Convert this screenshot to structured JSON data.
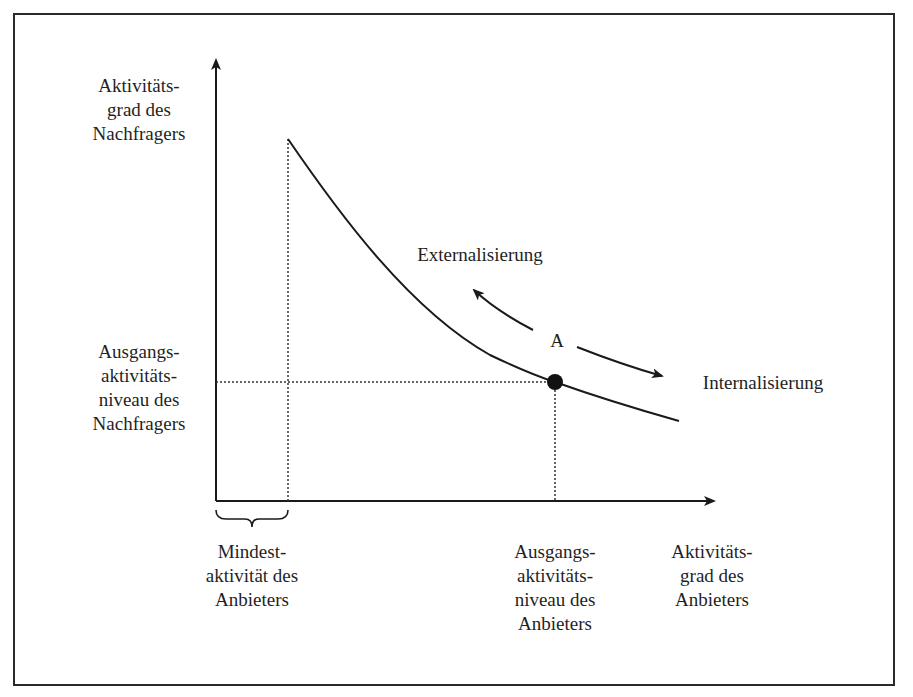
{
  "diagram": {
    "y_axis_label": [
      "Aktivitäts-",
      "grad des",
      "Nachfragers"
    ],
    "y_reference_label": [
      "Ausgangs-",
      "aktivitäts-",
      "niveau des",
      "Nachfragers"
    ],
    "x_axis_label": [
      "Aktivitäts-",
      "grad des",
      "Anbieters"
    ],
    "x_reference_label": [
      "Ausgangs-",
      "aktivitäts-",
      "niveau des",
      "Anbieters"
    ],
    "x_min_label": [
      "Mindest-",
      "aktivität des",
      "Anbieters"
    ],
    "point_label": "A",
    "direction_left_label": "Externalisierung",
    "direction_right_label": "Internalisierung",
    "colors": {
      "line": "#1a1a1a",
      "background": "#ffffff"
    }
  }
}
